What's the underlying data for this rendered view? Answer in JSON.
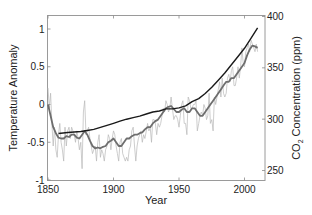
{
  "chart_data": {
    "type": "line",
    "title": "",
    "xlabel": "Year",
    "ylabel": "Temperature Anomaly",
    "y2label": "CO",
    "y2label_sub": "2",
    "y2label_rest": " Concentration (ppm)",
    "xlim": [
      1850,
      2013
    ],
    "ylim": [
      -1,
      1.2
    ],
    "y2lim": [
      250,
      400
    ],
    "grid": false,
    "x_ticks": [
      1850,
      1900,
      1950,
      2000
    ],
    "x_tick_labels": [
      "1850",
      "1900",
      "1950",
      "2000"
    ],
    "y_ticks": [
      -1,
      -0.5,
      0,
      0.5,
      1
    ],
    "y_tick_labels": [
      "-1",
      "-0.5",
      "0",
      "0.5",
      "1"
    ],
    "y2_ticks": [
      250,
      300,
      350,
      400
    ],
    "y2_tick_labels": [
      "250",
      "300",
      "350",
      "400"
    ],
    "series": [
      {
        "name": "Annual temperature anomaly",
        "axis": "left",
        "color": "#b8b8b8",
        "x": [
          1850,
          1851,
          1852,
          1853,
          1854,
          1855,
          1856,
          1857,
          1858,
          1859,
          1860,
          1861,
          1862,
          1863,
          1864,
          1865,
          1866,
          1867,
          1868,
          1869,
          1870,
          1871,
          1872,
          1873,
          1874,
          1875,
          1876,
          1877,
          1878,
          1879,
          1880,
          1881,
          1882,
          1883,
          1884,
          1885,
          1886,
          1887,
          1888,
          1889,
          1890,
          1891,
          1892,
          1893,
          1894,
          1895,
          1896,
          1897,
          1898,
          1899,
          1900,
          1901,
          1902,
          1903,
          1904,
          1905,
          1906,
          1907,
          1908,
          1909,
          1910,
          1911,
          1912,
          1913,
          1914,
          1915,
          1916,
          1917,
          1918,
          1919,
          1920,
          1921,
          1922,
          1923,
          1924,
          1925,
          1926,
          1927,
          1928,
          1929,
          1930,
          1931,
          1932,
          1933,
          1934,
          1935,
          1936,
          1937,
          1938,
          1939,
          1940,
          1941,
          1942,
          1943,
          1944,
          1945,
          1946,
          1947,
          1948,
          1949,
          1950,
          1951,
          1952,
          1953,
          1954,
          1955,
          1956,
          1957,
          1958,
          1959,
          1960,
          1961,
          1962,
          1963,
          1964,
          1965,
          1966,
          1967,
          1968,
          1969,
          1970,
          1971,
          1972,
          1973,
          1974,
          1975,
          1976,
          1977,
          1978,
          1979,
          1980,
          1981,
          1982,
          1983,
          1984,
          1985,
          1986,
          1987,
          1988,
          1989,
          1990,
          1991,
          1992,
          1993,
          1994,
          1995,
          1996,
          1997,
          1998,
          1999,
          2000,
          2001,
          2002,
          2003,
          2004,
          2005,
          2006,
          2007,
          2008,
          2009,
          2010
        ],
        "values": [
          0.22,
          -0.05,
          0.15,
          -0.25,
          -0.55,
          -0.3,
          -0.6,
          -0.7,
          -0.4,
          -0.25,
          -0.5,
          -0.6,
          -0.75,
          -0.3,
          -0.55,
          -0.35,
          -0.3,
          -0.45,
          -0.3,
          -0.35,
          -0.4,
          -0.5,
          -0.35,
          -0.45,
          -0.6,
          -0.5,
          -0.85,
          -0.1,
          0.05,
          -0.4,
          -0.35,
          -0.3,
          -0.45,
          -0.55,
          -0.65,
          -0.6,
          -0.55,
          -0.75,
          -0.5,
          -0.4,
          -0.7,
          -0.6,
          -0.65,
          -0.75,
          -0.6,
          -0.55,
          -0.4,
          -0.45,
          -0.6,
          -0.45,
          -0.35,
          -0.4,
          -0.55,
          -0.65,
          -0.75,
          -0.5,
          -0.45,
          -0.65,
          -0.7,
          -0.75,
          -0.7,
          -0.75,
          -0.6,
          -0.55,
          -0.35,
          -0.3,
          -0.55,
          -0.75,
          -0.55,
          -0.45,
          -0.4,
          -0.35,
          -0.5,
          -0.4,
          -0.45,
          -0.35,
          -0.25,
          -0.35,
          -0.3,
          -0.5,
          -0.2,
          -0.2,
          -0.25,
          -0.4,
          -0.25,
          -0.3,
          -0.25,
          -0.15,
          -0.05,
          -0.1,
          0.05,
          0.0,
          -0.1,
          -0.05,
          0.1,
          -0.05,
          -0.2,
          -0.15,
          -0.15,
          -0.2,
          -0.3,
          -0.15,
          0.0,
          0.05,
          -0.25,
          -0.25,
          -0.4,
          0.1,
          0.05,
          -0.05,
          -0.05,
          0.0,
          0.0,
          0.05,
          -0.35,
          -0.25,
          -0.15,
          -0.1,
          -0.15,
          0.0,
          -0.05,
          -0.2,
          -0.15,
          0.15,
          -0.25,
          -0.2,
          -0.35,
          0.1,
          0.0,
          0.1,
          0.2,
          0.3,
          0.1,
          0.35,
          0.15,
          0.1,
          0.15,
          0.35,
          0.4,
          0.3,
          0.45,
          0.5,
          0.25,
          0.25,
          0.35,
          0.5,
          0.35,
          0.5,
          0.75,
          0.55,
          0.5,
          0.7,
          0.75,
          0.8,
          0.7,
          0.85,
          0.8,
          0.75,
          0.7,
          0.8,
          0.7
        ]
      },
      {
        "name": "Smoothed temperature anomaly",
        "axis": "left",
        "color": "#6e6e6e",
        "x": [
          1850,
          1852,
          1854,
          1856,
          1858,
          1860,
          1862,
          1864,
          1866,
          1868,
          1870,
          1872,
          1874,
          1876,
          1878,
          1880,
          1882,
          1884,
          1886,
          1888,
          1890,
          1892,
          1894,
          1896,
          1898,
          1900,
          1902,
          1904,
          1906,
          1908,
          1910,
          1912,
          1914,
          1916,
          1918,
          1920,
          1922,
          1924,
          1926,
          1928,
          1930,
          1932,
          1934,
          1936,
          1938,
          1940,
          1942,
          1944,
          1946,
          1948,
          1950,
          1952,
          1954,
          1956,
          1958,
          1960,
          1962,
          1964,
          1966,
          1968,
          1970,
          1972,
          1974,
          1976,
          1978,
          1980,
          1982,
          1984,
          1986,
          1988,
          1990,
          1992,
          1994,
          1996,
          1998,
          2000,
          2002,
          2004,
          2006,
          2008,
          2010
        ],
        "values": [
          0.0,
          -0.15,
          -0.3,
          -0.38,
          -0.44,
          -0.45,
          -0.45,
          -0.42,
          -0.43,
          -0.4,
          -0.4,
          -0.44,
          -0.45,
          -0.4,
          -0.35,
          -0.4,
          -0.48,
          -0.55,
          -0.58,
          -0.57,
          -0.58,
          -0.56,
          -0.55,
          -0.5,
          -0.48,
          -0.45,
          -0.5,
          -0.55,
          -0.55,
          -0.5,
          -0.45,
          -0.45,
          -0.42,
          -0.4,
          -0.4,
          -0.38,
          -0.37,
          -0.33,
          -0.3,
          -0.3,
          -0.25,
          -0.22,
          -0.2,
          -0.15,
          -0.1,
          -0.05,
          -0.03,
          -0.02,
          -0.06,
          -0.1,
          -0.1,
          -0.07,
          -0.05,
          -0.1,
          -0.1,
          -0.05,
          -0.05,
          -0.1,
          -0.15,
          -0.15,
          -0.1,
          -0.05,
          0.0,
          0.05,
          0.1,
          0.15,
          0.2,
          0.25,
          0.3,
          0.3,
          0.35,
          0.35,
          0.4,
          0.45,
          0.5,
          0.55,
          0.65,
          0.73,
          0.78,
          0.77,
          0.75
        ]
      },
      {
        "name": "CO2 concentration",
        "axis": "right",
        "color": "#1a1a1a",
        "x": [
          1858,
          1865,
          1870,
          1875,
          1880,
          1885,
          1890,
          1895,
          1900,
          1905,
          1910,
          1915,
          1920,
          1925,
          1930,
          1935,
          1940,
          1945,
          1950,
          1955,
          1960,
          1965,
          1970,
          1975,
          1980,
          1985,
          1990,
          1995,
          2000,
          2005,
          2010
        ],
        "values": [
          286,
          287,
          287.5,
          288,
          289,
          290,
          292,
          294,
          296,
          298,
          300,
          301.5,
          303,
          305,
          307,
          308,
          310,
          310,
          311,
          313,
          317,
          320,
          325,
          331,
          338,
          345,
          353,
          361,
          369,
          379,
          389
        ]
      }
    ]
  }
}
